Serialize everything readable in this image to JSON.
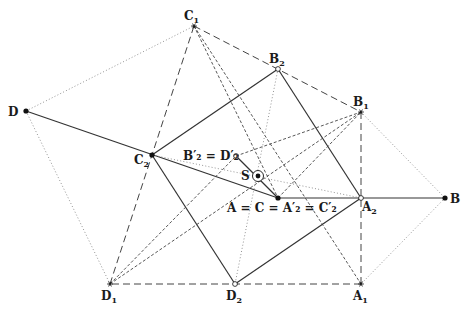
{
  "diagram": {
    "title": "",
    "points": [
      {
        "id": "C1",
        "label": "C",
        "sub": "1",
        "prime": false,
        "x": 194,
        "y": 26,
        "marker": "star",
        "lx": 184,
        "ly": 20
      },
      {
        "id": "B2",
        "label": "B",
        "sub": "2",
        "prime": false,
        "x": 278,
        "y": 69,
        "marker": "circle-open",
        "lx": 269,
        "ly": 63
      },
      {
        "id": "B1",
        "label": "B",
        "sub": "1",
        "prime": false,
        "x": 361,
        "y": 112,
        "marker": "star",
        "lx": 353,
        "ly": 106
      },
      {
        "id": "D",
        "label": "D",
        "sub": "",
        "prime": false,
        "x": 26,
        "y": 111,
        "marker": "dot",
        "lx": 8,
        "ly": 116
      },
      {
        "id": "C2",
        "label": "C",
        "sub": "2",
        "prime": false,
        "x": 152,
        "y": 155,
        "marker": "dot",
        "lx": 134,
        "ly": 164
      },
      {
        "id": "B2p",
        "label": "B′₂ = D′₂",
        "sub": "",
        "prime": true,
        "x": 236,
        "y": 156,
        "marker": "circle-open",
        "lx": 183,
        "ly": 160
      },
      {
        "id": "S",
        "label": "S",
        "sub": "",
        "prime": false,
        "x": 258,
        "y": 176,
        "marker": "target",
        "lx": 241,
        "ly": 180
      },
      {
        "id": "A",
        "label": "A = C = A′₂ = C′₂",
        "sub": "",
        "prime": true,
        "x": 278,
        "y": 198,
        "marker": "dot",
        "lx": 227,
        "ly": 212
      },
      {
        "id": "A2",
        "label": "A",
        "sub": "2",
        "prime": false,
        "x": 361,
        "y": 198,
        "marker": "circle-open",
        "lx": 362,
        "ly": 211
      },
      {
        "id": "B",
        "label": "B",
        "sub": "",
        "prime": false,
        "x": 445,
        "y": 198,
        "marker": "dot",
        "lx": 450,
        "ly": 203
      },
      {
        "id": "D1",
        "label": "D",
        "sub": "1",
        "prime": false,
        "x": 110,
        "y": 284,
        "marker": "star",
        "lx": 101,
        "ly": 300
      },
      {
        "id": "D2",
        "label": "D",
        "sub": "2",
        "prime": false,
        "x": 235,
        "y": 284,
        "marker": "circle-open",
        "lx": 226,
        "ly": 300
      },
      {
        "id": "A1",
        "label": "A",
        "sub": "1",
        "prime": false,
        "x": 361,
        "y": 284,
        "marker": "star",
        "lx": 353,
        "ly": 300
      }
    ],
    "segments": [
      {
        "from": "D",
        "to": "A",
        "style": "solid"
      },
      {
        "from": "A",
        "to": "B",
        "style": "solid"
      },
      {
        "from": "C2",
        "to": "B2",
        "style": "solid"
      },
      {
        "from": "B2",
        "to": "A2",
        "style": "solid"
      },
      {
        "from": "A2",
        "to": "D2",
        "style": "solid"
      },
      {
        "from": "D2",
        "to": "C2",
        "style": "solid"
      },
      {
        "from": "B2p",
        "to": "A",
        "style": "solid"
      },
      {
        "from": "C1",
        "to": "B1",
        "style": "long-dash"
      },
      {
        "from": "B1",
        "to": "A1",
        "style": "long-dash"
      },
      {
        "from": "A1",
        "to": "D1",
        "style": "long-dash"
      },
      {
        "from": "D1",
        "to": "C1",
        "style": "long-dash"
      },
      {
        "from": "C1",
        "to": "A1",
        "style": "dash"
      },
      {
        "from": "C1",
        "to": "A",
        "style": "dash"
      },
      {
        "from": "D1",
        "to": "B1",
        "style": "dash"
      },
      {
        "from": "D1",
        "to": "B2p",
        "style": "dash"
      },
      {
        "from": "B2p",
        "to": "B1",
        "style": "dash"
      },
      {
        "from": "A",
        "to": "B1",
        "style": "dash"
      },
      {
        "from": "D",
        "to": "C1",
        "style": "dot"
      },
      {
        "from": "D",
        "to": "D1",
        "style": "dot"
      },
      {
        "from": "B1",
        "to": "B",
        "style": "dot"
      },
      {
        "from": "B",
        "to": "A1",
        "style": "dot"
      },
      {
        "from": "C2",
        "to": "A2",
        "style": "dot"
      },
      {
        "from": "B2",
        "to": "D2",
        "style": "dot"
      }
    ],
    "colors": {
      "solid": "#333333",
      "dash": "#444444",
      "dot": "#888888",
      "marker": "#111111"
    }
  }
}
